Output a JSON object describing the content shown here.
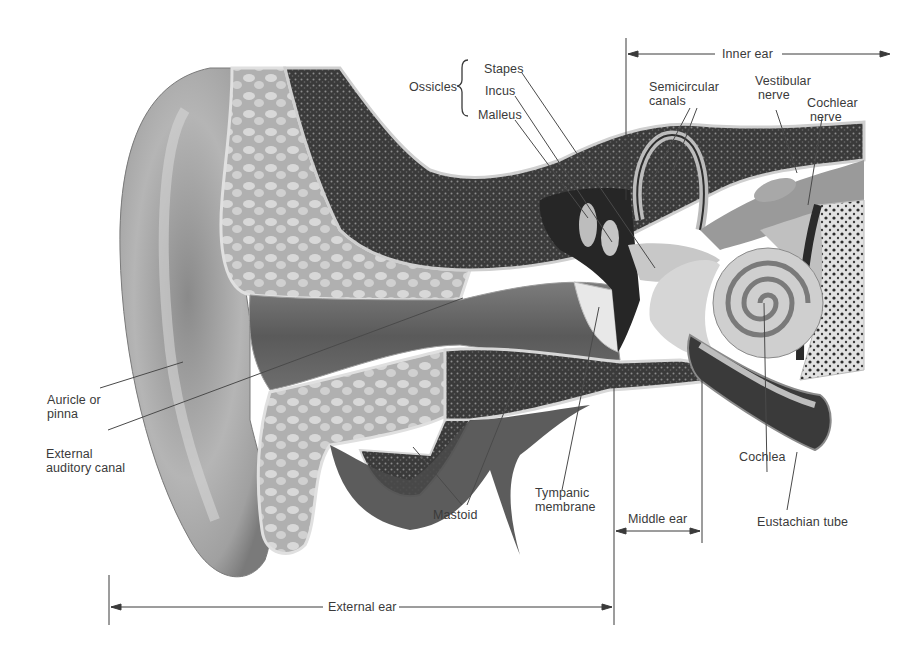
{
  "figure": {
    "colors": {
      "background": "#ffffff",
      "text": "#3a3a3a",
      "leader_line": "#4a4a4a",
      "skin_light": "#d4d4d4",
      "skin_mid": "#9a9a9a",
      "skin_dark": "#5c5c5c",
      "bone_dark": "#2e2e2e",
      "cartilage": "#c8c8c8"
    }
  },
  "labels": {
    "ossicles_group": "Ossicles",
    "stapes": "Stapes",
    "incus": "Incus",
    "malleus": "Malleus",
    "semicircular_canals": [
      "Semicircular",
      "canals"
    ],
    "vestibular_nerve": [
      "Vestibular",
      "nerve"
    ],
    "cochlear_nerve": [
      "Cochlear",
      "nerve"
    ],
    "auricle": [
      "Auricle or",
      "pinna"
    ],
    "external_auditory_canal": [
      "External",
      "auditory canal"
    ],
    "mastoid": "Mastoid",
    "tympanic_membrane": [
      "Tympanic",
      "membrane"
    ],
    "cochlea": "Cochlea",
    "eustachian_tube": "Eustachian tube"
  },
  "dimensions": {
    "inner_ear": "Inner ear",
    "middle_ear": "Middle ear",
    "external_ear": "External ear"
  }
}
